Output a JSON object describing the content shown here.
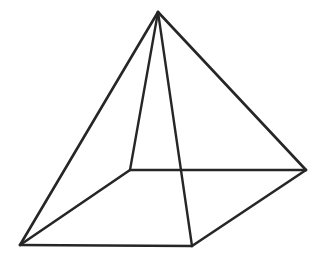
{
  "figure": {
    "kind": "wireframe-line-drawing",
    "shape_name": "square-pyramid",
    "canvas": {
      "width": 328,
      "height": 267
    },
    "background_color": "#ffffff",
    "stroke_color": "#262626",
    "stroke_width": 2.6,
    "vertices": {
      "apex": {
        "name": "apex",
        "x": 158,
        "y": 12
      },
      "back": {
        "name": "base-back",
        "x": 130,
        "y": 170
      },
      "left": {
        "name": "base-left",
        "x": 20,
        "y": 245
      },
      "front": {
        "name": "base-front",
        "x": 192,
        "y": 246
      },
      "right": {
        "name": "base-right",
        "x": 306,
        "y": 170
      }
    },
    "edges": [
      {
        "name": "edge-apex-left",
        "from": "apex",
        "to": "left",
        "path": "M 158 12 L 20 245",
        "hidden": false
      },
      {
        "name": "edge-apex-right",
        "from": "apex",
        "to": "right",
        "path": "M 158 12 L 306 170",
        "hidden": false
      },
      {
        "name": "edge-apex-back",
        "from": "apex",
        "to": "back",
        "path": "M 158 12 L 130 170",
        "hidden": false
      },
      {
        "name": "edge-apex-front",
        "from": "apex",
        "to": "front",
        "path": "M 158 12 L 192 246",
        "hidden": false
      },
      {
        "name": "edge-base-left-back",
        "from": "left",
        "to": "back",
        "path": "M 20 245 L 130 170",
        "hidden": false
      },
      {
        "name": "edge-base-back-right",
        "from": "back",
        "to": "right",
        "path": "M 130 170 L 306 170",
        "hidden": false
      },
      {
        "name": "edge-base-left-front",
        "from": "left",
        "to": "front",
        "path": "M 20 245 L 192 246",
        "hidden": false
      },
      {
        "name": "edge-base-front-right",
        "from": "front",
        "to": "right",
        "path": "M 192 246 L 306 170",
        "hidden": false
      }
    ],
    "labels": [],
    "annotations": []
  }
}
